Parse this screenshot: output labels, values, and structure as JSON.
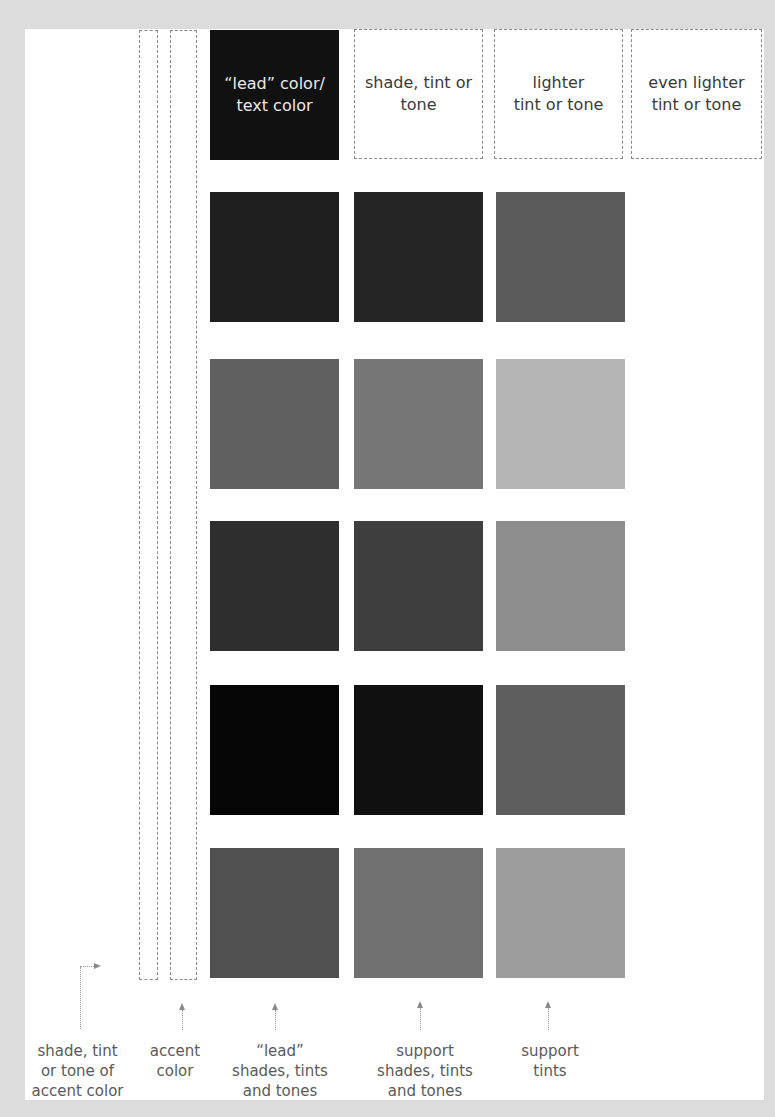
{
  "header": {
    "lead_label": "“lead” color/\ntext color",
    "col2_label": "shade, tint or\ntone",
    "col3_label": "lighter\ntint or tone",
    "col4_label": "even lighter\ntint or tone"
  },
  "swatch_rows": [
    {
      "lead": "#1f1f1f",
      "support": "#252525",
      "tint": "#5a5a5a"
    },
    {
      "lead": "#606060",
      "support": "#767676",
      "tint": "#b4b4b4"
    },
    {
      "lead": "#2e2e2e",
      "support": "#3e3e3e",
      "tint": "#8e8e8e"
    },
    {
      "lead": "#050505",
      "support": "#101010",
      "tint": "#5e5e5e"
    },
    {
      "lead": "#505050",
      "support": "#717171",
      "tint": "#9d9d9d"
    }
  ],
  "captions": {
    "accent_shade": "shade, tint\nor tone of\naccent color",
    "accent": "accent\ncolor",
    "lead": "“lead”\nshades, tints\nand tones",
    "support": "support\nshades, tints\nand tones",
    "support_tints": "support\ntints"
  },
  "colors": {
    "background": "#dcdcdc",
    "page": "#ffffff",
    "lead_header": "#111111",
    "dashed_border": "#8a8a8a",
    "caption_text": "#5a5a5a"
  }
}
